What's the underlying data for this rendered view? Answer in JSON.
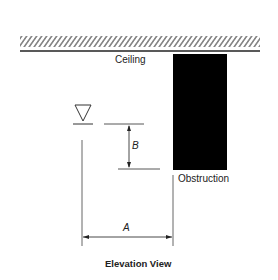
{
  "diagram": {
    "title": "Elevation View",
    "labels": {
      "ceiling": "Ceiling",
      "obstruction": "Obstruction",
      "dim_a": "A",
      "dim_b": "B"
    },
    "elements": [
      {
        "id": "ceiling",
        "type": "hatched-surface"
      },
      {
        "id": "obstruction",
        "type": "solid-rectangle",
        "color": "#000000"
      },
      {
        "id": "sprinkler",
        "type": "inverted-triangle-symbol"
      },
      {
        "id": "dimension-a",
        "type": "horizontal-dimension",
        "label": "A",
        "meaning": "horizontal distance from sprinkler to obstruction"
      },
      {
        "id": "dimension-b",
        "type": "vertical-dimension",
        "label": "B",
        "meaning": "vertical distance from sprinkler deflector to bottom of obstruction"
      }
    ],
    "colors": {
      "line": "#333333",
      "fill": "#000000",
      "background": "#ffffff"
    }
  }
}
